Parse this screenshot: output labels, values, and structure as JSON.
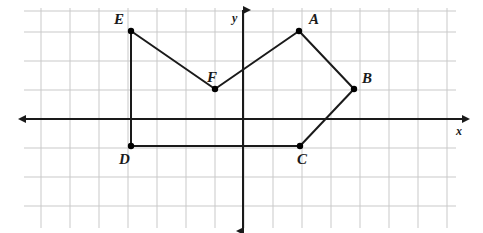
{
  "figure": {
    "background_color": "#ffffff",
    "grid_color": "#c9c9c9",
    "axis_color": "#1a1a1a",
    "shape_color": "#1a1a1a",
    "point_color": "#000000"
  },
  "axes": {
    "x_label": "x",
    "y_label": "y",
    "x_label_pos": {
      "x": 456,
      "y": 135
    },
    "y_label_pos": {
      "x": 232,
      "y": 22
    },
    "origin": {
      "x": 243,
      "y": 119
    },
    "grid_spacing": 29,
    "x_axis": {
      "x1": 26,
      "y1": 119,
      "x2": 463,
      "y2": 119
    },
    "y_axis": {
      "x1": 243,
      "y1": 10,
      "x2": 243,
      "y2": 231
    }
  },
  "grid": {
    "vertical_lines": [
      41,
      70,
      99,
      128,
      157,
      186,
      215,
      244,
      273,
      302,
      331,
      360,
      389,
      418,
      447
    ],
    "horizontal_lines": [
      11,
      32,
      61,
      90,
      119,
      148,
      177,
      206
    ],
    "x_extent": [
      24,
      456
    ],
    "y_extent": [
      8,
      228
    ]
  },
  "shape": {
    "name": "hexagon-abcdef",
    "closed": true,
    "vertices": [
      {
        "label": "A",
        "px": 299,
        "py": 31,
        "label_x": 309,
        "label_y": 24,
        "grid_x": 2,
        "grid_y": 3
      },
      {
        "label": "B",
        "px": 354,
        "py": 89,
        "label_x": 362,
        "label_y": 83,
        "grid_x": 4,
        "grid_y": 1
      },
      {
        "label": "C",
        "px": 300,
        "py": 146,
        "label_x": 297,
        "label_y": 164,
        "grid_x": 2,
        "grid_y": -1
      },
      {
        "label": "D",
        "px": 131,
        "py": 146,
        "label_x": 119,
        "label_y": 164,
        "grid_x": -4,
        "grid_y": -1
      },
      {
        "label": "E",
        "px": 131,
        "py": 31,
        "label_x": 114,
        "label_y": 24,
        "grid_x": -4,
        "grid_y": 3
      },
      {
        "label": "F",
        "px": 215,
        "py": 89,
        "label_x": 207,
        "label_y": 82,
        "grid_x": -1,
        "grid_y": 1
      }
    ],
    "edges": [
      {
        "from": "A",
        "to": "B"
      },
      {
        "from": "B",
        "to": "C"
      },
      {
        "from": "C",
        "to": "D"
      },
      {
        "from": "D",
        "to": "E"
      },
      {
        "from": "E",
        "to": "F"
      },
      {
        "from": "F",
        "to": "A"
      }
    ]
  }
}
